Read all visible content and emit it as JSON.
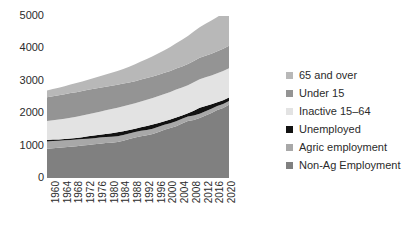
{
  "chart_data": {
    "type": "area",
    "title": "",
    "subtitle": "",
    "xlabel": "",
    "ylabel": "",
    "grid": false,
    "legend_position": "right",
    "stacked": true,
    "xlim": [
      1960,
      2022
    ],
    "ylim": [
      0,
      5000
    ],
    "yticks": [
      0,
      1000,
      2000,
      3000,
      4000,
      5000
    ],
    "xticks": [
      1960,
      1964,
      1968,
      1972,
      1976,
      1980,
      1984,
      1988,
      1992,
      1996,
      2000,
      2004,
      2008,
      2012,
      2016,
      2020
    ],
    "x": [
      1960,
      1962,
      1964,
      1966,
      1968,
      1970,
      1972,
      1974,
      1976,
      1978,
      1980,
      1982,
      1984,
      1986,
      1988,
      1990,
      1992,
      1994,
      1996,
      1998,
      2000,
      2002,
      2004,
      2006,
      2008,
      2010,
      2012,
      2014,
      2016,
      2018,
      2020,
      2022
    ],
    "series": [
      {
        "name": "Non-Ag Employment",
        "color": "#808080",
        "values": [
          900,
          915,
          930,
          950,
          965,
          980,
          1000,
          1020,
          1040,
          1060,
          1080,
          1090,
          1110,
          1150,
          1200,
          1250,
          1290,
          1320,
          1360,
          1420,
          1490,
          1540,
          1600,
          1680,
          1760,
          1790,
          1850,
          1930,
          2010,
          2100,
          2160,
          2260
        ]
      },
      {
        "name": "Agric employment",
        "color": "#a8a8a8",
        "values": [
          230,
          225,
          220,
          215,
          210,
          205,
          200,
          195,
          190,
          188,
          185,
          182,
          180,
          178,
          175,
          172,
          168,
          165,
          160,
          158,
          155,
          150,
          148,
          145,
          140,
          138,
          135,
          132,
          128,
          125,
          122,
          120
        ]
      },
      {
        "name": "Unemployed",
        "color": "#121212",
        "values": [
          40,
          45,
          42,
          40,
          45,
          50,
          60,
          70,
          80,
          85,
          95,
          110,
          120,
          115,
          105,
          95,
          105,
          120,
          130,
          120,
          105,
          115,
          120,
          105,
          95,
          150,
          180,
          160,
          135,
          110,
          120,
          105
        ]
      },
      {
        "name": "Inactive 15–64",
        "color": "#e3e3e3",
        "values": [
          590,
          600,
          610,
          625,
          640,
          655,
          670,
          685,
          700,
          715,
          730,
          745,
          760,
          770,
          780,
          790,
          800,
          810,
          820,
          830,
          840,
          850,
          860,
          865,
          870,
          875,
          880,
          885,
          890,
          895,
          900,
          905
        ]
      },
      {
        "name": "Under 15",
        "color": "#949494",
        "values": [
          730,
          740,
          750,
          755,
          760,
          760,
          755,
          750,
          745,
          740,
          730,
          720,
          710,
          700,
          690,
          680,
          675,
          670,
          665,
          660,
          655,
          650,
          650,
          650,
          655,
          660,
          665,
          670,
          675,
          680,
          685,
          690
        ]
      },
      {
        "name": "65 and over",
        "color": "#b8b8b8",
        "values": [
          210,
          220,
          235,
          250,
          265,
          280,
          295,
          315,
          335,
          355,
          375,
          400,
          425,
          455,
          485,
          520,
          555,
          590,
          625,
          660,
          700,
          740,
          780,
          820,
          865,
          905,
          945,
          985,
          1020,
          1060,
          1095,
          1120
        ]
      }
    ]
  },
  "y_axis": {
    "ticks": [
      "5000",
      "4000",
      "3000",
      "2000",
      "1000",
      "0"
    ]
  },
  "x_axis": {
    "ticks": [
      "1960",
      "1964",
      "1968",
      "1972",
      "1976",
      "1980",
      "1984",
      "1988",
      "1992",
      "1996",
      "2000",
      "2004",
      "2008",
      "2012",
      "2016",
      "2020"
    ]
  },
  "legend": {
    "items": [
      {
        "label": "65 and over",
        "color": "#b8b8b8",
        "swatch_name": "legend-swatch-65-and-over"
      },
      {
        "label": "Under 15",
        "color": "#949494",
        "swatch_name": "legend-swatch-under-15"
      },
      {
        "label": "Inactive 15–64",
        "color": "#e3e3e3",
        "swatch_name": "legend-swatch-inactive-15-64"
      },
      {
        "label": "Unemployed",
        "color": "#121212",
        "swatch_name": "legend-swatch-unemployed"
      },
      {
        "label": "Agric employment",
        "color": "#a8a8a8",
        "swatch_name": "legend-swatch-agric-employment"
      },
      {
        "label": "Non-Ag Employment",
        "color": "#808080",
        "swatch_name": "legend-swatch-non-ag-employment"
      }
    ]
  }
}
